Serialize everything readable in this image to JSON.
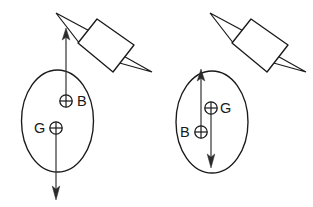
{
  "figure": {
    "background_color": "#ffffff",
    "line_color": "#1a1a1a",
    "vector_color": "#2b2b2b",
    "width": 313,
    "height": 207,
    "panels": [
      {
        "id": "left",
        "name": "stable-configuration",
        "hull": {
          "shape": "ellipse",
          "cx": 57.5,
          "cy": 121,
          "rx": 36,
          "ry": 51
        },
        "pin": {
          "name": "push-pin",
          "body_points": "78,43 97,19 134,45 113,72",
          "spike_upper": "80,44 56,13 97,35",
          "spike_lower": "116,62 152,72 111,49"
        },
        "markers": [
          {
            "name": "buoyancy-centre",
            "label": "B",
            "label_side": "right",
            "cx": 66,
            "cy": 101,
            "r": 6.2,
            "label_x": 77,
            "label_y": 102
          },
          {
            "name": "gravity-centre",
            "label": "G",
            "label_side": "left",
            "cx": 56,
            "cy": 128,
            "r": 6.2,
            "label_x": 38,
            "label_y": 129
          }
        ],
        "vectors": [
          {
            "name": "buoyancy-force-up",
            "direction": "up",
            "x": 66,
            "y_tail": 101,
            "y_tip": 30
          },
          {
            "name": "gravity-force-down",
            "direction": "down",
            "x": 56,
            "y_tail": 128,
            "y_tip": 198
          }
        ]
      },
      {
        "id": "right",
        "name": "unstable-configuration",
        "hull": {
          "shape": "ellipse",
          "cx": 212,
          "cy": 122,
          "rx": 36,
          "ry": 51
        },
        "pin": {
          "name": "push-pin",
          "body_points": "232,43 251,19 288,45 267,72",
          "spike_upper": "234,44 210,13 251,35",
          "spike_lower": "270,62 306,72 265,49"
        },
        "markers": [
          {
            "name": "gravity-centre",
            "label": "G",
            "label_side": "right",
            "cx": 211,
            "cy": 108,
            "r": 6.2,
            "label_x": 222,
            "label_y": 109
          },
          {
            "name": "buoyancy-centre",
            "label": "B",
            "label_side": "left",
            "cx": 201,
            "cy": 132,
            "r": 6.2,
            "label_x": 183,
            "label_y": 133
          }
        ],
        "vectors": [
          {
            "name": "buoyancy-force-up",
            "direction": "up",
            "x": 201,
            "y_tail": 132,
            "y_tip": 71
          },
          {
            "name": "gravity-force-down",
            "direction": "down",
            "x": 211,
            "y_tail": 108,
            "y_tip": 166
          }
        ]
      }
    ]
  }
}
